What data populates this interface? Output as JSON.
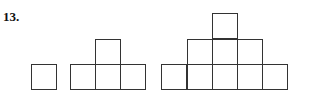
{
  "problem": {
    "number_label": "13."
  },
  "figures": [
    {
      "name": "figure-1",
      "rows": [
        1
      ],
      "squares": [
        [
          31,
          64
        ]
      ]
    },
    {
      "name": "figure-2",
      "rows": [
        1,
        3
      ],
      "squares": [
        [
          95,
          39
        ],
        [
          70,
          64
        ],
        [
          95,
          64
        ],
        [
          120,
          64
        ]
      ]
    },
    {
      "name": "figure-3",
      "rows": [
        1,
        3,
        5
      ],
      "squares": [
        [
          212,
          13
        ],
        [
          187,
          39
        ],
        [
          212,
          39
        ],
        [
          237,
          39
        ],
        [
          161,
          64
        ],
        [
          187,
          64
        ],
        [
          212,
          64
        ],
        [
          237,
          64
        ],
        [
          262,
          64
        ]
      ]
    }
  ],
  "square_size": 25,
  "stroke_color": "#333333"
}
